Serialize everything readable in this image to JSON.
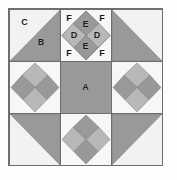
{
  "diagram": {
    "grid": {
      "rows": 3,
      "cols": 3
    },
    "colors": {
      "background": "#fdfdfd",
      "frame_border": "#6e6e6e",
      "light": "#f2f2f2",
      "medium": "#b8b8b8",
      "dark": "#999999",
      "outline": "#6e6e6e",
      "label_text": "#1a1a1a"
    },
    "legend": {
      "A": "center square",
      "B": "large corner triangle",
      "C": "large corner background triangle",
      "D": "side square of on-point four patch",
      "E": "top and bottom square of on-point four patch",
      "F": "corner background triangle of square-in-a-square"
    },
    "units": [
      {
        "position": "top-left",
        "type": "half-square-triangle",
        "labels": [
          {
            "text": "C",
            "x": 30,
            "y": 24
          },
          {
            "text": "B",
            "x": 63,
            "y": 64
          }
        ]
      },
      {
        "position": "top-center",
        "type": "on-point-four-patch",
        "labels": [
          {
            "text": "F",
            "x": 17,
            "y": 16
          },
          {
            "text": "F",
            "x": 83,
            "y": 16
          },
          {
            "text": "F",
            "x": 17,
            "y": 85
          },
          {
            "text": "F",
            "x": 83,
            "y": 85
          },
          {
            "text": "E",
            "x": 50,
            "y": 28
          },
          {
            "text": "E",
            "x": 50,
            "y": 72
          },
          {
            "text": "D",
            "x": 27,
            "y": 50
          },
          {
            "text": "D",
            "x": 73,
            "y": 50
          }
        ]
      },
      {
        "position": "top-right",
        "type": "half-square-triangle",
        "labels": []
      },
      {
        "position": "middle-left",
        "type": "on-point-four-patch",
        "labels": []
      },
      {
        "position": "center",
        "type": "solid-square",
        "labels": [
          {
            "text": "A",
            "x": 50,
            "y": 50
          }
        ]
      },
      {
        "position": "middle-right",
        "type": "on-point-four-patch",
        "labels": []
      },
      {
        "position": "bottom-left",
        "type": "half-square-triangle",
        "labels": []
      },
      {
        "position": "bottom-center",
        "type": "on-point-four-patch",
        "labels": []
      },
      {
        "position": "bottom-right",
        "type": "half-square-triangle",
        "labels": []
      }
    ]
  }
}
